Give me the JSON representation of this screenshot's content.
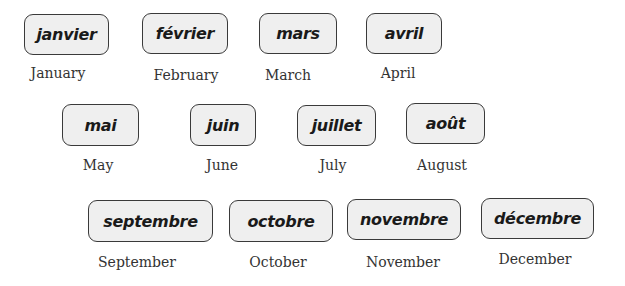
{
  "months": [
    {
      "french": "janvier",
      "english": "January"
    },
    {
      "french": "février",
      "english": "February"
    },
    {
      "french": "mars",
      "english": "March"
    },
    {
      "french": "avril",
      "english": "April"
    },
    {
      "french": "mai",
      "english": "May"
    },
    {
      "french": "juin",
      "english": "June"
    },
    {
      "french": "juillet",
      "english": "July"
    },
    {
      "french": "août",
      "english": "August"
    },
    {
      "french": "septembre",
      "english": "September"
    },
    {
      "french": "octobre",
      "english": "October"
    },
    {
      "french": "novembre",
      "english": "November"
    },
    {
      "french": "décembre",
      "english": "December"
    }
  ],
  "colors": {
    "card_fill": "#efefef",
    "card_border": "#3a3a3a",
    "french_text": "#1a1a1a",
    "english_text": "#333333"
  }
}
